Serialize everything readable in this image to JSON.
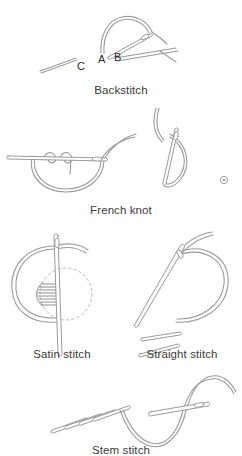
{
  "page": {
    "background_color": "#ffffff",
    "line_color": "#9a9a9f",
    "label_color": "#3b3b3b",
    "width": 242,
    "height": 456
  },
  "figures": [
    {
      "id": "backstitch",
      "caption": "Backstitch",
      "point_labels": [
        {
          "name": "C",
          "text": "C"
        },
        {
          "name": "A",
          "text": "A"
        },
        {
          "name": "B",
          "text": "B"
        }
      ],
      "elements": [
        "needle",
        "thread-loop",
        "fabric-line",
        "completed-stitch"
      ]
    },
    {
      "id": "french-knot",
      "caption": "French knot",
      "point_labels": [],
      "elements": [
        "needle-horizontal",
        "thread-wrapped-twice",
        "thread-loop",
        "needle-vertical",
        "finished-knot-dot"
      ]
    },
    {
      "id": "satin-stitch",
      "caption": "Satin stitch",
      "point_labels": [],
      "elements": [
        "needle-vertical",
        "thread-loop",
        "dotted-shape-outline",
        "filled-parallel-stitches"
      ]
    },
    {
      "id": "straight-stitch",
      "caption": "Straight stitch",
      "point_labels": [],
      "elements": [
        "needle-diagonal",
        "thread-loop",
        "completed-stitch-1",
        "completed-stitch-2"
      ]
    },
    {
      "id": "stem-stitch",
      "caption": "Stem stitch",
      "point_labels": [],
      "elements": [
        "overlapping-slanted-stitches",
        "needle",
        "thread-curve"
      ]
    }
  ]
}
